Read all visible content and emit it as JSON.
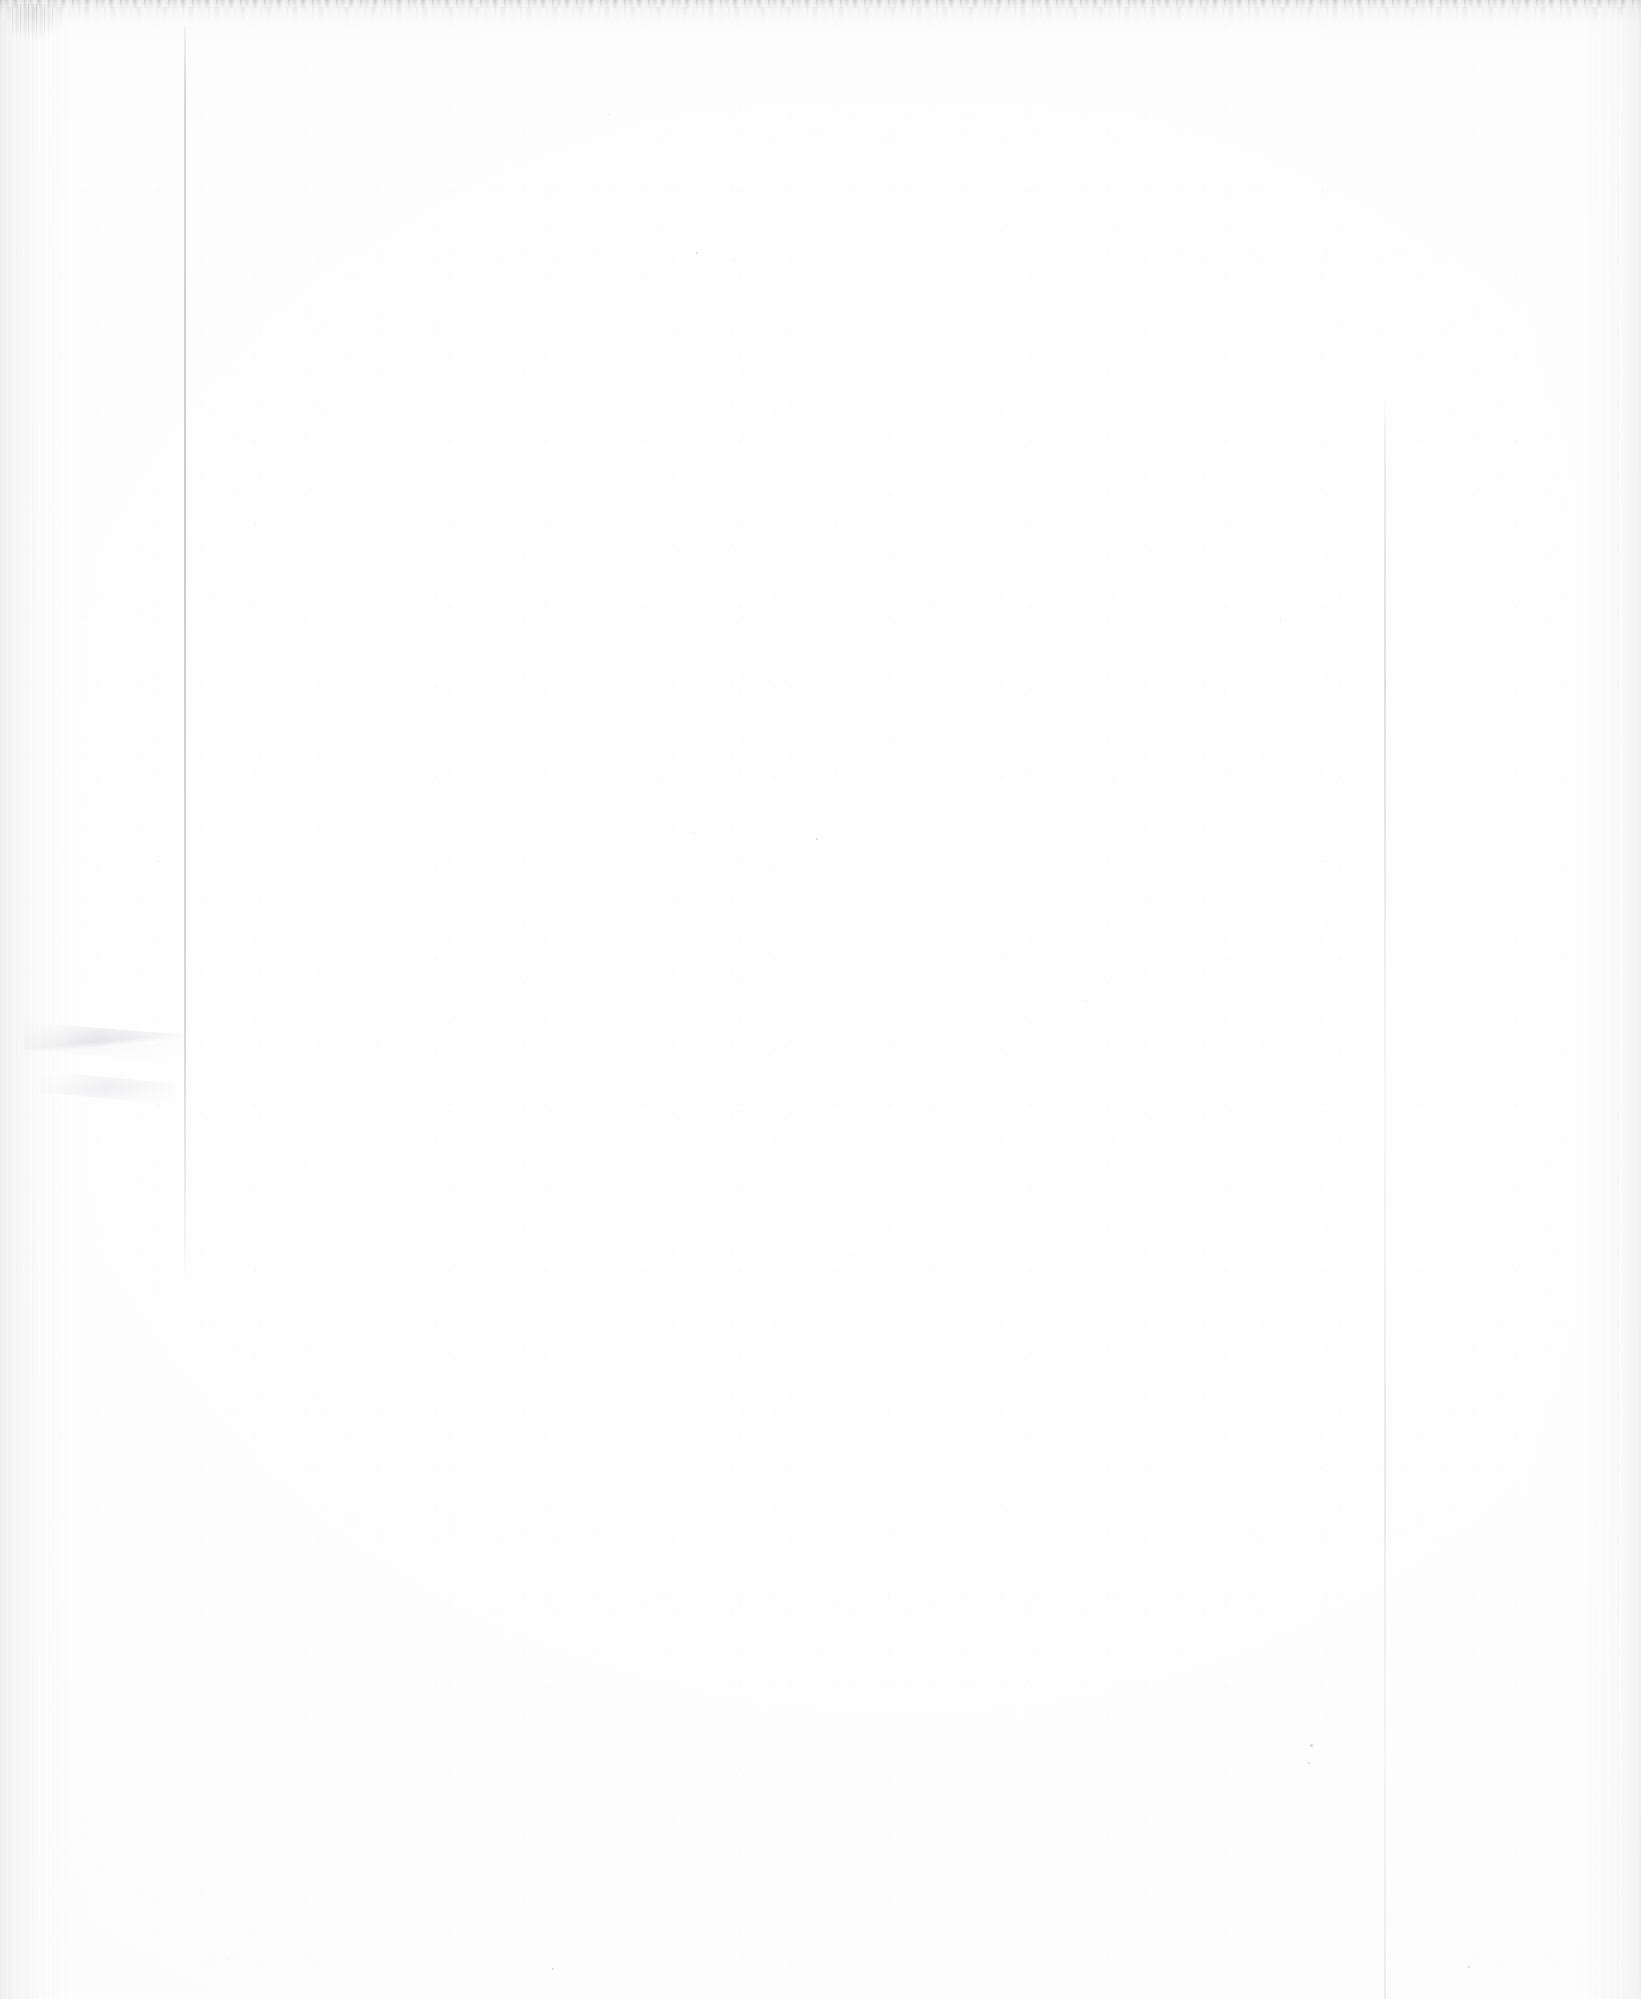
{
  "document": {
    "kind": "scanned-page",
    "content_state": "blank",
    "page_label": "",
    "visible_text": "",
    "caption": "Blank scanned page"
  },
  "canvas": {
    "width_px": 1641,
    "height_px": 1999
  },
  "colors": {
    "paper": "#fdfdfd",
    "paper_highlight": "#ffffff",
    "edge_shadow": "#ececed",
    "rule_line": "#cdcdd4",
    "top_artifact": "#8c8c90",
    "speck": "#b2b2b6"
  },
  "artifacts": [
    {
      "name": "top-edge-streak",
      "description": "ragged dark scanner streak along the top edge",
      "x": 0,
      "y": 0,
      "width": 1641,
      "height": 9
    },
    {
      "name": "corner-smudge",
      "description": "dark smudge cluster at top-left corner",
      "x": 12,
      "y": 4,
      "width": 62,
      "height": 40
    },
    {
      "name": "left-edge-band",
      "description": "vertical gray streak band along left margin",
      "x": 0,
      "y": 0,
      "width": 72,
      "height": 1999
    },
    {
      "name": "right-edge-band",
      "description": "vertical gray streak band along right margin",
      "x": 1577,
      "y": 0,
      "width": 64,
      "height": 1999
    },
    {
      "name": "left-vertical-rule",
      "description": "faint vertical page-edge line on the left",
      "x": 184,
      "y": 26,
      "width": 2,
      "height": 1252
    },
    {
      "name": "right-vertical-rule",
      "description": "faint vertical page-edge line on the right",
      "x": 1384,
      "y": 398,
      "width": 2,
      "height": 1601
    },
    {
      "name": "lower-left-crease",
      "description": "faint diagonal fold crease in the lower-left area",
      "x": 24,
      "y": 1022,
      "width": 160,
      "height": 28
    }
  ],
  "specks": [
    {
      "x": 696,
      "y": 252,
      "size": 2
    },
    {
      "x": 734,
      "y": 258,
      "size": 1
    },
    {
      "x": 816,
      "y": 838,
      "size": 2
    },
    {
      "x": 694,
      "y": 832,
      "size": 1
    },
    {
      "x": 1310,
      "y": 1744,
      "size": 3
    },
    {
      "x": 1308,
      "y": 1762,
      "size": 2
    },
    {
      "x": 1468,
      "y": 1966,
      "size": 2
    },
    {
      "x": 552,
      "y": 1968,
      "size": 2
    },
    {
      "x": 228,
      "y": 1958,
      "size": 1
    },
    {
      "x": 608,
      "y": 114,
      "size": 1
    },
    {
      "x": 1086,
      "y": 1000,
      "size": 1
    },
    {
      "x": 1280,
      "y": 620,
      "size": 1
    }
  ]
}
